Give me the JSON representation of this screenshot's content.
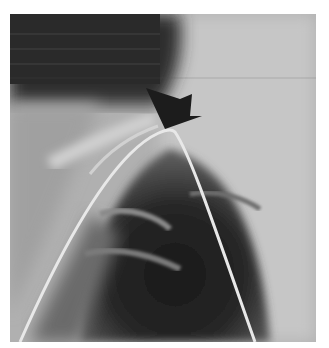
{
  "image": {
    "kind": "grayscale radiograph",
    "description": "Chest X-ray showing a curved catheter line forming an arch over the lung apex, with a black arrow pointing to the apex of the curve",
    "annotation": {
      "type": "arrow",
      "color": "#1a1a1a",
      "points_to": "catheter apex"
    },
    "colors": {
      "background": "#ffffff",
      "lung_dark": "#1e1e1e",
      "soft_tissue": "#bdbdbd",
      "line": "#e6e6e6"
    }
  }
}
